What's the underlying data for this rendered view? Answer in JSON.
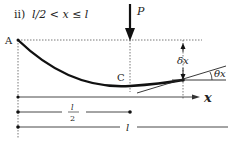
{
  "title": {
    "prefix": "ii)",
    "condition": "l/2 < x ≤ l"
  },
  "labels": {
    "support": "A",
    "load": "P",
    "midpoint": "C",
    "deflection": "δx",
    "slope": "θx",
    "axis": "x",
    "half_span": "l",
    "half_span_den": "2",
    "span": "l"
  },
  "colors": {
    "stroke": "#222222",
    "guide": "#555555",
    "background": "#ffffff"
  }
}
